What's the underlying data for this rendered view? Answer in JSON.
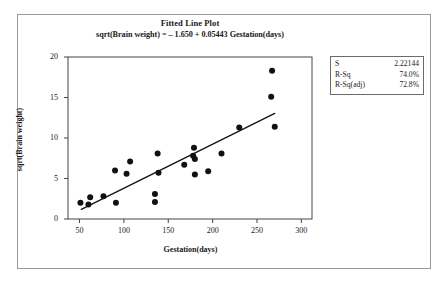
{
  "figure": {
    "title": "Fitted Line Plot",
    "subtitle": "sqrt(Brain weight) = – 1.650 + 0.05443 Gestation(days)"
  },
  "stats_box": {
    "rows": [
      {
        "key": "S",
        "value": "2.22144"
      },
      {
        "key": "R-Sq",
        "value": "74.0%"
      },
      {
        "key": "R-Sq(adj)",
        "value": "72.8%"
      }
    ]
  },
  "axes": {
    "x_label": "Gestation(days)",
    "y_label": "sqrt(Brain weight)",
    "x_ticks": [
      "50",
      "100",
      "150",
      "200",
      "250",
      "300"
    ],
    "y_ticks": [
      "0",
      "5",
      "10",
      "15",
      "20"
    ]
  },
  "chart_data": {
    "type": "scatter",
    "title": "Fitted Line Plot",
    "subtitle": "sqrt(Brain weight) = – 1.650 + 0.05443 Gestation(days)",
    "xlabel": "Gestation(days)",
    "ylabel": "sqrt(Brain weight)",
    "xlim": [
      37,
      312
    ],
    "ylim": [
      0,
      20
    ],
    "x_ticks": [
      50,
      100,
      150,
      200,
      250,
      300
    ],
    "y_ticks": [
      0,
      5,
      10,
      15,
      20
    ],
    "grid": false,
    "legend": false,
    "marker": {
      "shape": "circle",
      "color": "#111111",
      "size": 3
    },
    "points": [
      {
        "x": 51,
        "y": 2.0
      },
      {
        "x": 60,
        "y": 1.8
      },
      {
        "x": 62,
        "y": 2.7
      },
      {
        "x": 77,
        "y": 2.8
      },
      {
        "x": 90,
        "y": 6.0
      },
      {
        "x": 91,
        "y": 2.0
      },
      {
        "x": 103,
        "y": 5.6
      },
      {
        "x": 107,
        "y": 7.1
      },
      {
        "x": 135,
        "y": 3.1
      },
      {
        "x": 135,
        "y": 2.1
      },
      {
        "x": 138,
        "y": 8.1
      },
      {
        "x": 139,
        "y": 5.7
      },
      {
        "x": 168,
        "y": 6.7
      },
      {
        "x": 178,
        "y": 7.8
      },
      {
        "x": 179,
        "y": 8.8
      },
      {
        "x": 180,
        "y": 7.4
      },
      {
        "x": 180,
        "y": 5.5
      },
      {
        "x": 195,
        "y": 5.9
      },
      {
        "x": 210,
        "y": 8.1
      },
      {
        "x": 230,
        "y": 11.3
      },
      {
        "x": 267,
        "y": 18.3
      },
      {
        "x": 266,
        "y": 15.1
      },
      {
        "x": 270,
        "y": 11.4
      }
    ],
    "fit_line": {
      "intercept": -1.65,
      "slope": 0.05443,
      "x_start": 52,
      "x_end": 270,
      "y_start": 1.18,
      "y_end": 13.04,
      "color": "#111111"
    },
    "annotations": {
      "S": "2.22144",
      "R-Sq": "74.0%",
      "R-Sq(adj)": "72.8%"
    }
  }
}
